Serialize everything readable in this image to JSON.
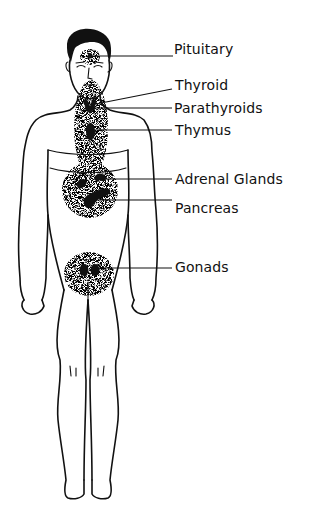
{
  "figure": {
    "labels": [
      {
        "id": "pituitary",
        "text": "Pituitary"
      },
      {
        "id": "thyroid",
        "text": "Thyroid"
      },
      {
        "id": "parathyroids",
        "text": "Parathyroids"
      },
      {
        "id": "thymus",
        "text": "Thymus"
      },
      {
        "id": "adrenal",
        "text": "Adrenal Glands"
      },
      {
        "id": "pancreas",
        "text": "Pancreas"
      },
      {
        "id": "gonads",
        "text": "Gonads"
      }
    ],
    "colors": {
      "ink": "#111111",
      "background": "#ffffff"
    }
  }
}
